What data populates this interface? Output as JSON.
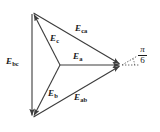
{
  "figure": {
    "type": "phasor-diagram",
    "background_color": "#ffffff",
    "line_color": "#3c3c3c",
    "text_color": "#1a1a1a"
  },
  "labels": {
    "e_bc": {
      "base": "E",
      "sub": "bc",
      "x": 6,
      "y": 57
    },
    "e_c": {
      "base": "E",
      "sub": "c",
      "x": 50,
      "y": 34
    },
    "e_ca": {
      "base": "E",
      "sub": "ca",
      "x": 75,
      "y": 24
    },
    "e_a": {
      "base": "E",
      "sub": "a",
      "x": 73,
      "y": 52
    },
    "e_b": {
      "base": "E",
      "sub": "b",
      "x": 48,
      "y": 89
    },
    "e_ab": {
      "base": "E",
      "sub": "ab",
      "x": 74,
      "y": 93
    }
  },
  "angle": {
    "numerator": "π",
    "denominator": "6",
    "x": 138,
    "y": 45
  },
  "geometry": {
    "center": {
      "x": 60,
      "y": 65
    },
    "vertex_top": {
      "x": 32,
      "y": 12
    },
    "vertex_bottom": {
      "x": 32,
      "y": 118
    },
    "vertex_right": {
      "x": 122,
      "y": 65
    },
    "dotted_ref_end": {
      "x": 139,
      "y": 65
    },
    "dotted_arc_start_angle_deg": -30,
    "dotted_arc_end_angle_deg": 0
  },
  "vectors": [
    {
      "name": "E_a",
      "from": "center",
      "to": "vertex_right"
    },
    {
      "name": "E_b",
      "from": "center",
      "to": "vertex_bottom"
    },
    {
      "name": "E_c",
      "from": "center",
      "to": "vertex_top"
    },
    {
      "name": "E_bc",
      "from": "vertex_top",
      "to": "vertex_bottom"
    },
    {
      "name": "E_ca",
      "from": "vertex_top",
      "to": "vertex_right"
    },
    {
      "name": "E_ab",
      "from": "vertex_bottom",
      "to": "vertex_right"
    }
  ]
}
